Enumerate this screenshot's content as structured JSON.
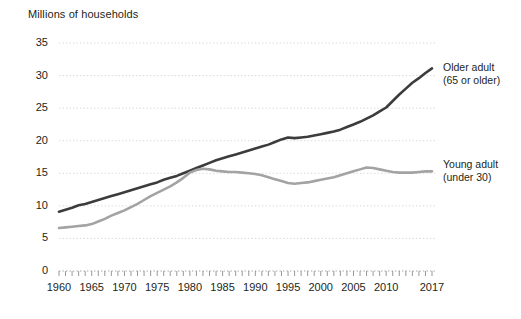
{
  "chart_data": {
    "type": "line",
    "title": "Millions of households",
    "xlabel": "",
    "ylabel": "Millions of households",
    "ylim": [
      0,
      35
    ],
    "xlim": [
      1960,
      2017
    ],
    "yticks": [
      0,
      5,
      10,
      15,
      20,
      25,
      30,
      35
    ],
    "xticks": [
      1960,
      1965,
      1970,
      1975,
      1980,
      1985,
      1990,
      1995,
      2000,
      2005,
      2010,
      2017
    ],
    "grid": true,
    "legend_position": "right-inline",
    "x": [
      1960,
      1961,
      1962,
      1963,
      1964,
      1965,
      1966,
      1967,
      1968,
      1969,
      1970,
      1971,
      1972,
      1973,
      1974,
      1975,
      1976,
      1977,
      1978,
      1979,
      1980,
      1981,
      1982,
      1983,
      1984,
      1985,
      1986,
      1987,
      1988,
      1989,
      1990,
      1991,
      1992,
      1993,
      1994,
      1995,
      1996,
      1997,
      1998,
      1999,
      2000,
      2001,
      2002,
      2003,
      2004,
      2005,
      2006,
      2007,
      2008,
      2009,
      2010,
      2011,
      2012,
      2013,
      2014,
      2015,
      2016,
      2017
    ],
    "series": [
      {
        "name": "Older adult (65 or older)",
        "legend_line1": "Older adult",
        "legend_line2": "(65 or older)",
        "color": "#3c3c3c",
        "values": [
          9.1,
          9.4,
          9.7,
          10.1,
          10.3,
          10.6,
          10.9,
          11.2,
          11.5,
          11.8,
          12.1,
          12.4,
          12.7,
          13.0,
          13.3,
          13.6,
          14.0,
          14.3,
          14.6,
          15.0,
          15.4,
          15.8,
          16.2,
          16.6,
          17.0,
          17.3,
          17.6,
          17.9,
          18.2,
          18.5,
          18.8,
          19.1,
          19.4,
          19.8,
          20.2,
          20.5,
          20.4,
          20.5,
          20.6,
          20.8,
          21.0,
          21.2,
          21.4,
          21.7,
          22.1,
          22.5,
          22.9,
          23.4,
          23.9,
          24.5,
          25.1,
          26.1,
          27.1,
          28.0,
          28.9,
          29.6,
          30.4,
          31.1
        ]
      },
      {
        "name": "Young adult (under 30)",
        "legend_line1": "Young adult",
        "legend_line2": "(under 30)",
        "color": "#a3a3a3",
        "values": [
          6.6,
          6.7,
          6.8,
          6.9,
          7.0,
          7.2,
          7.6,
          8.0,
          8.5,
          8.9,
          9.3,
          9.8,
          10.3,
          10.9,
          11.5,
          12.0,
          12.5,
          13.0,
          13.6,
          14.3,
          15.1,
          15.5,
          15.7,
          15.6,
          15.4,
          15.3,
          15.2,
          15.2,
          15.1,
          15.0,
          14.9,
          14.7,
          14.4,
          14.1,
          13.8,
          13.5,
          13.4,
          13.5,
          13.6,
          13.8,
          14.0,
          14.2,
          14.4,
          14.7,
          15.0,
          15.3,
          15.6,
          15.9,
          15.8,
          15.6,
          15.4,
          15.2,
          15.1,
          15.1,
          15.1,
          15.2,
          15.3,
          15.3
        ]
      }
    ]
  }
}
